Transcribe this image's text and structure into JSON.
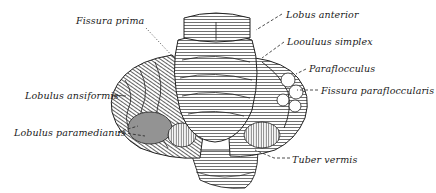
{
  "figure": {
    "colors": {
      "ink": "#1a1a1a",
      "paper": "#ffffff",
      "shade": "#6a6a6a"
    },
    "labels": [
      {
        "id": "fissura-prima",
        "text": "Fissura prima",
        "x": 76,
        "y": 16,
        "side": "left"
      },
      {
        "id": "lobus-anterior",
        "text": "Lobus anterior",
        "x": 286,
        "y": 10,
        "side": "right"
      },
      {
        "id": "lobulus-simplex",
        "text": "Loouluus simplex",
        "x": 287,
        "y": 37,
        "side": "right"
      },
      {
        "id": "paraflocculus",
        "text": "Paraflocculus",
        "x": 309,
        "y": 64,
        "side": "right"
      },
      {
        "id": "fissura-parafloccularis",
        "text": "Fissura parafloccularis",
        "x": 321,
        "y": 86,
        "side": "right"
      },
      {
        "id": "lobulus-ansiformis",
        "text": "Lobulus ansiformis",
        "x": 25,
        "y": 91,
        "side": "left"
      },
      {
        "id": "lobulus-paramedianus",
        "text": "Lobulus paramedianus",
        "x": 14,
        "y": 128,
        "side": "left"
      },
      {
        "id": "tuber-vermis",
        "text": "Tuber vermis",
        "x": 292,
        "y": 155,
        "side": "right"
      }
    ]
  }
}
